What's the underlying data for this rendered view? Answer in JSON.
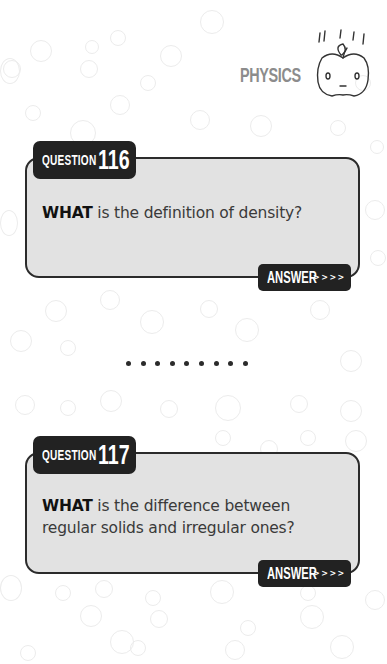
{
  "header": {
    "subject": "PHYSICS",
    "mascot_icon": "falling-apple-icon"
  },
  "cards": [
    {
      "tab_label": "QUESTION",
      "number": "116",
      "question_bold": "WHAT",
      "question_rest": " is the definition of density?",
      "answer_label": "ANSWER",
      "answer_arrows": ">>>>"
    },
    {
      "tab_label": "QUESTION",
      "number": "117",
      "question_bold": "WHAT",
      "question_rest": " is the difference between regular solids and irregular ones?",
      "answer_label": "ANSWER",
      "answer_arrows": ">>>>"
    }
  ],
  "separator": {
    "dot_count": 9
  },
  "colors": {
    "card_fill": "#e2e2e2",
    "dark": "#222222",
    "subject_gray": "#8c8c8c"
  }
}
